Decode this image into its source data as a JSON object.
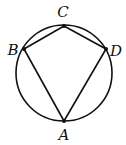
{
  "diagram": {
    "type": "inscribed-quadrilateral",
    "circle": {
      "cx": 64,
      "cy": 73,
      "r": 48
    },
    "points": [
      {
        "name": "A",
        "x": 64,
        "y": 121,
        "label_x": 64,
        "label_y": 140
      },
      {
        "name": "B",
        "x": 24,
        "y": 49,
        "label_x": 13,
        "label_y": 55
      },
      {
        "name": "C",
        "x": 64,
        "y": 26,
        "label_x": 63,
        "label_y": 17
      },
      {
        "name": "D",
        "x": 106,
        "y": 49,
        "label_x": 116,
        "label_y": 56
      }
    ],
    "segments": [
      "AB",
      "BC",
      "CD",
      "DA"
    ],
    "stroke_color": "#111111",
    "background": "#ffffff"
  }
}
